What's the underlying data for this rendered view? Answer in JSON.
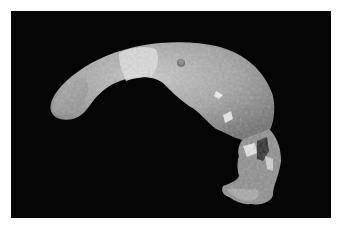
{
  "image": {
    "subject": "fossil-skull-calvaria",
    "background_color": "#050505",
    "border_color": "#ffffff",
    "bone_tones": [
      "#bdbdbd",
      "#9a9a9a",
      "#7a7a7a",
      "#e6e6e6"
    ]
  }
}
